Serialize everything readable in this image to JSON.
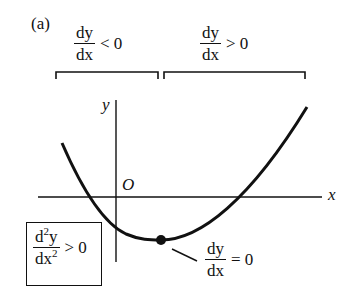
{
  "panel_label": "(a)",
  "brackets": {
    "left": {
      "numerator": "dy",
      "denominator": "dx",
      "relation": "< 0"
    },
    "right": {
      "numerator": "dy",
      "denominator": "dx",
      "relation": "> 0"
    }
  },
  "axes": {
    "x_label": "x",
    "y_label": "y",
    "origin_label": "O"
  },
  "minimum_point": {
    "numerator": "dy",
    "denominator": "dx",
    "relation": "= 0"
  },
  "concavity_box": {
    "numerator_d": "d",
    "numerator_sup": "2",
    "numerator_var": "y",
    "denominator_d": "dx",
    "denominator_sup": "2",
    "relation": "> 0"
  },
  "colors": {
    "ink": "#111111",
    "background": "#ffffff"
  }
}
